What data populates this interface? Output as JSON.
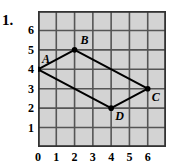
{
  "problem": {
    "number": "1."
  },
  "grid": {
    "fill_color": "#d3d3d3",
    "line_color": "#555555",
    "border_color": "#333333",
    "cols": 7,
    "rows": 7,
    "cell_px": 18.3,
    "x_min": 0,
    "x_max": 6,
    "y_min": 0,
    "y_max": 6
  },
  "axes": {
    "x_ticks": [
      "0",
      "1",
      "2",
      "3",
      "4",
      "5",
      "6"
    ],
    "y_ticks": [
      "6",
      "5",
      "4",
      "3",
      "2",
      "1"
    ],
    "origin_label": "0"
  },
  "figure": {
    "name": "parallelogram-abcd",
    "stroke_color": "#000000",
    "vertices": [
      {
        "label": "A",
        "x": 0,
        "y": 4,
        "label_dx": 4,
        "label_dy": -16
      },
      {
        "label": "B",
        "x": 2,
        "y": 5,
        "label_dx": 6,
        "label_dy": -16
      },
      {
        "label": "C",
        "x": 6,
        "y": 3,
        "label_dx": 4,
        "label_dy": 2
      },
      {
        "label": "D",
        "x": 4,
        "y": 2,
        "label_dx": 4,
        "label_dy": 2
      }
    ],
    "edges": [
      [
        "A",
        "B"
      ],
      [
        "B",
        "C"
      ],
      [
        "C",
        "D"
      ],
      [
        "D",
        "A"
      ]
    ]
  },
  "chart_data": {
    "type": "scatter",
    "title": "",
    "xlabel": "",
    "ylabel": "",
    "xlim": [
      0,
      7
    ],
    "ylim": [
      0,
      7
    ],
    "grid": true,
    "legend": "none",
    "points": [
      {
        "name": "A",
        "x": 0,
        "y": 4
      },
      {
        "name": "B",
        "x": 2,
        "y": 5
      },
      {
        "name": "C",
        "x": 6,
        "y": 3
      },
      {
        "name": "D",
        "x": 4,
        "y": 2
      }
    ],
    "x": [
      0,
      2,
      6,
      4
    ],
    "y": [
      4,
      5,
      3,
      2
    ],
    "xticks": [
      0,
      1,
      2,
      3,
      4,
      5,
      6
    ],
    "yticks": [
      1,
      2,
      3,
      4,
      5,
      6
    ],
    "annotations": [
      "A",
      "B",
      "C",
      "D"
    ],
    "shape": "parallelogram ABCD"
  }
}
